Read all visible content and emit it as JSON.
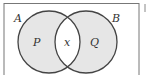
{
  "diagram": {
    "type": "venn",
    "sets": [
      {
        "name": "A",
        "region_label": "P"
      },
      {
        "name": "B",
        "region_label": "Q"
      }
    ],
    "intersection_label": "x",
    "colors": {
      "fill": "#e6e6e6",
      "intersection_fill": "#ffffff",
      "stroke": "#444444",
      "frame": "#777777"
    }
  }
}
